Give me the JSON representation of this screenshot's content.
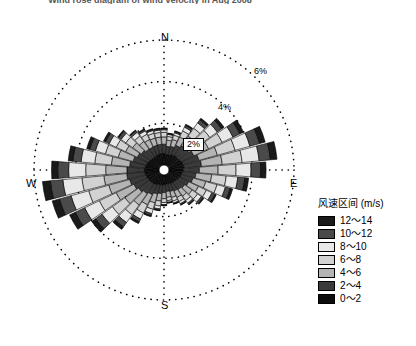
{
  "title": "Wind rose diagram of wind velocity in Aug 2008",
  "directions_label": {
    "north": "N",
    "east": "E",
    "south": "S",
    "west": "W"
  },
  "ring_labels": [
    "2%",
    "4%",
    "6%"
  ],
  "legend": {
    "title": "风速区间 (m/s)",
    "entries": [
      {
        "label": "12～14",
        "color": "#1a1a1a"
      },
      {
        "label": "10～12",
        "color": "#4a4a4a"
      },
      {
        "label": "8～10",
        "color": "#e8e8e8"
      },
      {
        "label": "6～8",
        "color": "#d2d2d2"
      },
      {
        "label": "4～6",
        "color": "#b4b4b4"
      },
      {
        "label": "2～4",
        "color": "#3a3a3a"
      },
      {
        "label": "0～2",
        "color": "#0d0d0d"
      }
    ]
  },
  "chart_data": {
    "type": "bar",
    "subtype": "wind-rose",
    "title": "Wind rose diagram of wind velocity in Aug 2008",
    "xlabel": "",
    "ylabel": "Frequency (%)",
    "rlim": [
      0,
      6
    ],
    "rticks": [
      2,
      4,
      6
    ],
    "rtick_labels": [
      "2%",
      "4%",
      "6%"
    ],
    "grid": true,
    "grid_style": "dotted",
    "legend_position": "right",
    "sector_count": 36,
    "sector_width_deg": 10,
    "cardinal_labels": [
      "N",
      "E",
      "S",
      "W"
    ],
    "bin_colors": [
      "#0d0d0d",
      "#3a3a3a",
      "#b4b4b4",
      "#d2d2d2",
      "#e8e8e8",
      "#4a4a4a",
      "#1a1a1a"
    ],
    "series": [
      {
        "name": "0～2",
        "color": "#0d0d0d",
        "values": [
          0.55,
          0.5,
          0.52,
          0.58,
          0.62,
          0.6,
          0.65,
          0.7,
          0.72,
          0.68,
          0.62,
          0.6,
          0.55,
          0.52,
          0.5,
          0.48,
          0.45,
          0.44,
          0.46,
          0.48,
          0.5,
          0.55,
          0.58,
          0.6,
          0.62,
          0.65,
          0.68,
          0.7,
          0.66,
          0.62,
          0.58,
          0.55,
          0.52,
          0.52,
          0.54,
          0.55
        ]
      },
      {
        "name": "2～4",
        "color": "#3a3a3a",
        "values": [
          0.45,
          0.4,
          0.42,
          0.5,
          0.58,
          0.62,
          0.7,
          0.8,
          0.85,
          0.78,
          0.68,
          0.6,
          0.52,
          0.46,
          0.42,
          0.4,
          0.38,
          0.36,
          0.38,
          0.42,
          0.46,
          0.52,
          0.58,
          0.66,
          0.74,
          0.82,
          0.88,
          0.84,
          0.76,
          0.68,
          0.6,
          0.54,
          0.48,
          0.46,
          0.45,
          0.45
        ]
      },
      {
        "name": "4～6",
        "color": "#b4b4b4",
        "values": [
          0.35,
          0.3,
          0.34,
          0.44,
          0.56,
          0.66,
          0.78,
          0.92,
          1.0,
          0.9,
          0.76,
          0.64,
          0.52,
          0.44,
          0.38,
          0.34,
          0.3,
          0.28,
          0.3,
          0.36,
          0.44,
          0.54,
          0.66,
          0.8,
          0.94,
          1.04,
          1.1,
          1.02,
          0.88,
          0.74,
          0.62,
          0.52,
          0.44,
          0.4,
          0.36,
          0.35
        ]
      },
      {
        "name": "6～8",
        "color": "#d2d2d2",
        "values": [
          0.22,
          0.18,
          0.22,
          0.32,
          0.46,
          0.58,
          0.72,
          0.88,
          0.96,
          0.86,
          0.7,
          0.56,
          0.42,
          0.32,
          0.26,
          0.22,
          0.18,
          0.16,
          0.18,
          0.24,
          0.32,
          0.44,
          0.58,
          0.74,
          0.9,
          1.0,
          1.06,
          0.96,
          0.8,
          0.64,
          0.5,
          0.4,
          0.32,
          0.28,
          0.24,
          0.22
        ]
      },
      {
        "name": "8～10",
        "color": "#e8e8e8",
        "values": [
          0.12,
          0.1,
          0.12,
          0.2,
          0.32,
          0.44,
          0.58,
          0.74,
          0.82,
          0.72,
          0.56,
          0.42,
          0.3,
          0.22,
          0.16,
          0.12,
          0.1,
          0.08,
          0.1,
          0.14,
          0.22,
          0.32,
          0.46,
          0.62,
          0.78,
          0.88,
          0.92,
          0.82,
          0.66,
          0.5,
          0.38,
          0.28,
          0.22,
          0.18,
          0.14,
          0.12
        ]
      },
      {
        "name": "10～12",
        "color": "#4a4a4a",
        "values": [
          0.06,
          0.04,
          0.06,
          0.1,
          0.18,
          0.26,
          0.36,
          0.48,
          0.54,
          0.46,
          0.34,
          0.24,
          0.16,
          0.1,
          0.07,
          0.05,
          0.04,
          0.03,
          0.04,
          0.06,
          0.1,
          0.16,
          0.26,
          0.38,
          0.5,
          0.58,
          0.6,
          0.52,
          0.4,
          0.28,
          0.2,
          0.14,
          0.1,
          0.08,
          0.06,
          0.06
        ]
      },
      {
        "name": "12～14",
        "color": "#1a1a1a",
        "values": [
          0.03,
          0.02,
          0.03,
          0.05,
          0.09,
          0.14,
          0.2,
          0.28,
          0.32,
          0.26,
          0.18,
          0.12,
          0.07,
          0.05,
          0.03,
          0.02,
          0.02,
          0.01,
          0.02,
          0.03,
          0.05,
          0.08,
          0.14,
          0.22,
          0.3,
          0.36,
          0.38,
          0.3,
          0.22,
          0.15,
          0.1,
          0.06,
          0.04,
          0.03,
          0.03,
          0.03
        ]
      }
    ]
  },
  "geometry": {
    "cx": 164,
    "cy": 170,
    "hub_radius": 5,
    "outer_radius": 130
  }
}
